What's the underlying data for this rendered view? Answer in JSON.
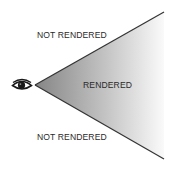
{
  "diagram": {
    "type": "view-frustum",
    "labels": {
      "top": "NOT RENDERED",
      "middle": "RENDERED",
      "bottom": "NOT RENDERED"
    },
    "icons": {
      "viewer": "eye-icon"
    },
    "colors": {
      "gradient_start": "#858585",
      "gradient_end": "#fafafa",
      "edge_line": "#333333",
      "text": "#2a2a2a"
    }
  }
}
